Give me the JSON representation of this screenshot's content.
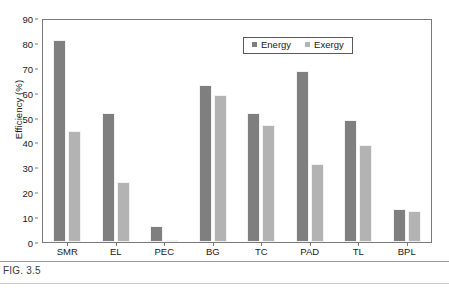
{
  "figure": {
    "caption": "FIG. 3.5"
  },
  "chart_data": {
    "type": "bar",
    "title": "",
    "xlabel": "",
    "ylabel": "Efficiency (%)",
    "ylim": [
      0,
      90
    ],
    "ytick_step": 10,
    "yticks": [
      0,
      10,
      20,
      30,
      40,
      50,
      60,
      70,
      80,
      90
    ],
    "ytick_labels": [
      "0",
      "10",
      "20",
      "30",
      "40",
      "50",
      "60",
      "70",
      "80",
      "90"
    ],
    "grid": false,
    "legend_position": "top-right",
    "categories": [
      "SMR",
      "EL",
      "PEC",
      "BG",
      "TC",
      "PAD",
      "TL",
      "BPL"
    ],
    "series": [
      {
        "name": "Energy",
        "color": "#7f7f7f",
        "values": [
          82,
          52.5,
          6.5,
          63.5,
          52.5,
          69.5,
          49.5,
          13.5
        ]
      },
      {
        "name": "Exergy",
        "color": "#b3b3b3",
        "values": [
          45,
          24.5,
          1,
          59.5,
          47.5,
          31.5,
          39.5,
          12.5
        ]
      }
    ]
  }
}
